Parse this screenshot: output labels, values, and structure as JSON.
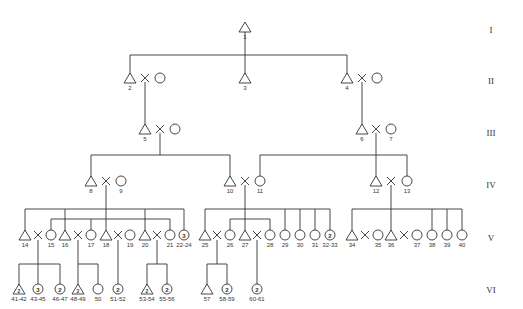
{
  "diagram": {
    "type": "pedigree",
    "generation_labels": [
      "I",
      "II",
      "III",
      "IV",
      "V",
      "VI"
    ],
    "legend_note": "triangle = male, circle = female, X = marriage, number inside symbol = count of siblings"
  },
  "individuals": [
    {
      "id": "1",
      "sex": "male",
      "gen": "I"
    },
    {
      "id": "2",
      "sex": "male",
      "gen": "II"
    },
    {
      "id": "3",
      "sex": "male",
      "gen": "II"
    },
    {
      "id": "4",
      "sex": "male",
      "gen": "II"
    },
    {
      "id": "5",
      "sex": "male",
      "gen": "III"
    },
    {
      "id": "6",
      "sex": "male",
      "gen": "III"
    },
    {
      "id": "7",
      "sex": "female",
      "gen": "III"
    },
    {
      "id": "8",
      "sex": "male",
      "gen": "IV"
    },
    {
      "id": "9",
      "sex": "female",
      "gen": "IV"
    },
    {
      "id": "10",
      "sex": "male",
      "gen": "IV"
    },
    {
      "id": "11",
      "sex": "female",
      "gen": "IV"
    },
    {
      "id": "12",
      "sex": "male",
      "gen": "IV"
    },
    {
      "id": "13",
      "sex": "female",
      "gen": "IV"
    },
    {
      "id": "14",
      "sex": "male",
      "gen": "V"
    },
    {
      "id": "15",
      "sex": "female",
      "gen": "V"
    },
    {
      "id": "16",
      "sex": "male",
      "gen": "V"
    },
    {
      "id": "17",
      "sex": "female",
      "gen": "V"
    },
    {
      "id": "18",
      "sex": "male",
      "gen": "V"
    },
    {
      "id": "19",
      "sex": "female",
      "gen": "V"
    },
    {
      "id": "20",
      "sex": "male",
      "gen": "V"
    },
    {
      "id": "21",
      "sex": "female",
      "gen": "V"
    },
    {
      "id": "22-24",
      "sex": "female",
      "gen": "V",
      "count": "3"
    },
    {
      "id": "25",
      "sex": "male",
      "gen": "V"
    },
    {
      "id": "26",
      "sex": "female",
      "gen": "V"
    },
    {
      "id": "27",
      "sex": "male",
      "gen": "V"
    },
    {
      "id": "28",
      "sex": "female",
      "gen": "V"
    },
    {
      "id": "29",
      "sex": "female",
      "gen": "V"
    },
    {
      "id": "30",
      "sex": "female",
      "gen": "V"
    },
    {
      "id": "31",
      "sex": "female",
      "gen": "V"
    },
    {
      "id": "32-33",
      "sex": "female",
      "gen": "V",
      "count": "2"
    },
    {
      "id": "34",
      "sex": "male",
      "gen": "V"
    },
    {
      "id": "35",
      "sex": "female",
      "gen": "V"
    },
    {
      "id": "36",
      "sex": "male",
      "gen": "V"
    },
    {
      "id": "37",
      "sex": "female",
      "gen": "V"
    },
    {
      "id": "38",
      "sex": "female",
      "gen": "V"
    },
    {
      "id": "39",
      "sex": "female",
      "gen": "V"
    },
    {
      "id": "40",
      "sex": "female",
      "gen": "V"
    },
    {
      "id": "41-42",
      "sex": "male",
      "gen": "VI",
      "count": "2"
    },
    {
      "id": "43-45",
      "sex": "female",
      "gen": "VI",
      "count": "3"
    },
    {
      "id": "46-47",
      "sex": "female",
      "gen": "VI",
      "count": "2"
    },
    {
      "id": "48-49",
      "sex": "male",
      "gen": "VI",
      "count": "2"
    },
    {
      "id": "50",
      "sex": "female",
      "gen": "VI"
    },
    {
      "id": "51-52",
      "sex": "female",
      "gen": "VI",
      "count": "2"
    },
    {
      "id": "53-54",
      "sex": "male",
      "gen": "VI",
      "count": "2"
    },
    {
      "id": "55-56",
      "sex": "female",
      "gen": "VI",
      "count": "2"
    },
    {
      "id": "57",
      "sex": "male",
      "gen": "VI"
    },
    {
      "id": "58-59",
      "sex": "female",
      "gen": "VI",
      "count": "2"
    },
    {
      "id": "60-61",
      "sex": "female",
      "gen": "VI",
      "count": "2"
    }
  ],
  "marriages": [
    [
      "2",
      "spouse"
    ],
    [
      "4",
      "spouse"
    ],
    [
      "5",
      "spouse"
    ],
    [
      "6",
      "7"
    ],
    [
      "8",
      "9"
    ],
    [
      "10",
      "11"
    ],
    [
      "12",
      "13"
    ],
    [
      "14",
      "15"
    ],
    [
      "16",
      "17"
    ],
    [
      "18",
      "19"
    ],
    [
      "20",
      "21"
    ],
    [
      "25",
      "26"
    ],
    [
      "27",
      "28"
    ],
    [
      "34",
      "35"
    ],
    [
      "36",
      "37"
    ]
  ]
}
